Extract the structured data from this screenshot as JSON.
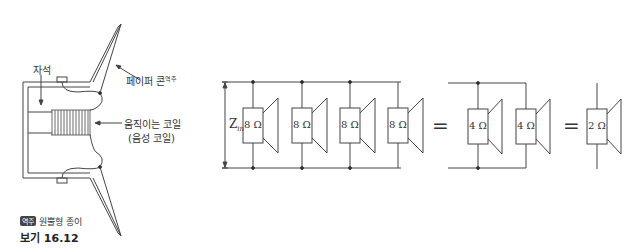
{
  "speaker_cross_section": {
    "magnet_label": "자석",
    "cone_label": "페이퍼 콘",
    "cone_label_note": "역주",
    "coil_label_line1": "움직이는 코일",
    "coil_label_line2": "(음성 코일)"
  },
  "footnote": {
    "badge": "역주",
    "text": "원뿔형 종이"
  },
  "figure_caption": "보기 16.12",
  "circuit": {
    "input_label": "Z",
    "input_label_sub": "in",
    "parallel_speakers": [
      {
        "impedance": "8 Ω"
      },
      {
        "impedance": "8 Ω"
      },
      {
        "impedance": "8 Ω"
      },
      {
        "impedance": "8 Ω"
      }
    ],
    "equals_1": "=",
    "pair_speakers": [
      {
        "impedance": "4 Ω"
      },
      {
        "impedance": "4 Ω"
      }
    ],
    "equals_2": "=",
    "single_speaker": {
      "impedance": "2 Ω"
    }
  }
}
